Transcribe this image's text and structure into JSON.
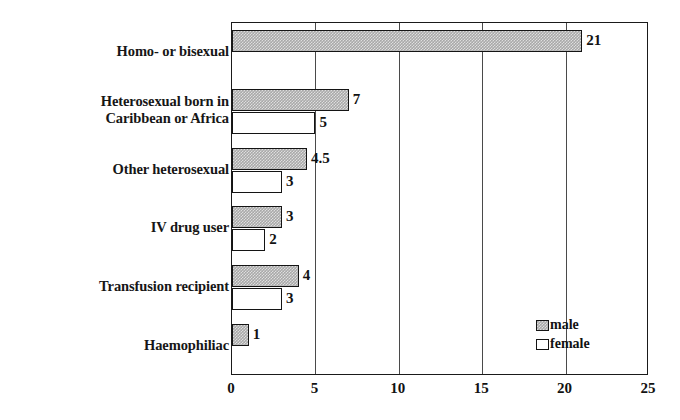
{
  "chart_data": {
    "type": "bar",
    "orientation": "horizontal",
    "title": "",
    "xlabel": "",
    "ylabel": "",
    "xlim": [
      0,
      25
    ],
    "xticks": [
      0,
      5,
      10,
      15,
      20,
      25
    ],
    "xtick_labels": [
      "0",
      "5",
      "10",
      "15",
      "20",
      "25"
    ],
    "grid": true,
    "grid_axis": "x",
    "legend_position": "bottom-right-inside",
    "categories": [
      "Homo- or bisexual",
      "Heterosexual born in\nCaribbean or Africa",
      "Other heterosexual",
      "IV drug user",
      "Transfusion recipient",
      "Haemophiliac"
    ],
    "series": [
      {
        "name": "male",
        "color": "#a9a9a9",
        "values": [
          21,
          7,
          4.5,
          3,
          4,
          1
        ],
        "labels": [
          "21",
          "7",
          "4.5",
          "3",
          "4",
          "1"
        ]
      },
      {
        "name": "female",
        "color": "#ffffff",
        "values": [
          0,
          5,
          3,
          2,
          3,
          0
        ],
        "labels": [
          "",
          "5",
          "3",
          "2",
          "3",
          ""
        ]
      }
    ]
  },
  "legend": {
    "items": [
      {
        "label": "male",
        "swatch": "male-swatch-icon"
      },
      {
        "label": "female",
        "swatch": "female-swatch-icon"
      }
    ]
  },
  "colors": {
    "male_fill": "#a9a9a9",
    "female_fill": "#ffffff",
    "bar_border": "#141414",
    "axis": "#1a1a1a",
    "gridline": "#4a4a4a",
    "text": "#121212",
    "background": "#ffffff"
  }
}
